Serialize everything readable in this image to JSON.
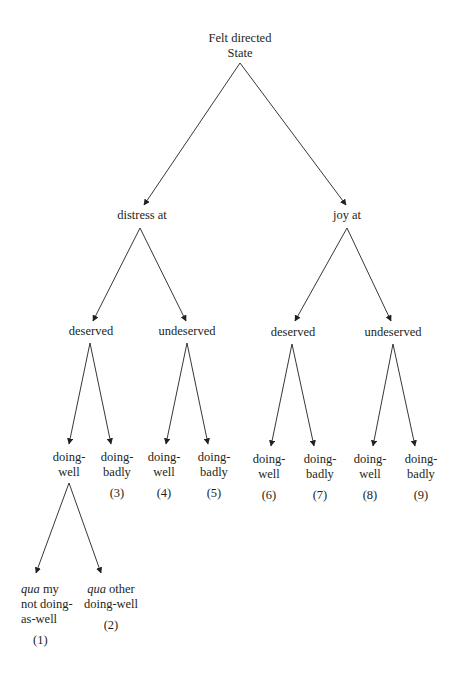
{
  "diagram": {
    "root": {
      "line1": "Felt directed",
      "line2": "State"
    },
    "level1": {
      "left": {
        "label": "distress at"
      },
      "right": {
        "label": "joy at"
      }
    },
    "level2": {
      "left_deserved": {
        "label": "deserved"
      },
      "left_undeserved": {
        "label": "undeserved"
      },
      "right_deserved": {
        "label": "deserved"
      },
      "right_undeserved": {
        "label": "undeserved"
      }
    },
    "level3": [
      {
        "line1": "doing-",
        "line2": "well",
        "number": ""
      },
      {
        "line1": "doing-",
        "line2": "badly",
        "number": "(3)"
      },
      {
        "line1": "doing-",
        "line2": "well",
        "number": "(4)"
      },
      {
        "line1": "doing-",
        "line2": "badly",
        "number": "(5)"
      },
      {
        "line1": "doing-",
        "line2": "well",
        "number": "(6)"
      },
      {
        "line1": "doing-",
        "line2": "badly",
        "number": "(7)"
      },
      {
        "line1": "doing-",
        "line2": "well",
        "number": "(8)"
      },
      {
        "line1": "doing-",
        "line2": "badly",
        "number": "(9)"
      }
    ],
    "level4": [
      {
        "italic": "qua",
        "rest1": " my",
        "line2": "not doing-",
        "line3": "as-well",
        "number": "(1)"
      },
      {
        "italic": "qua",
        "rest1": " other",
        "line2": "doing-well",
        "number": "(2)"
      }
    ],
    "colors": {
      "text": "#231f20",
      "line": "#231f20",
      "background": "#ffffff"
    }
  }
}
